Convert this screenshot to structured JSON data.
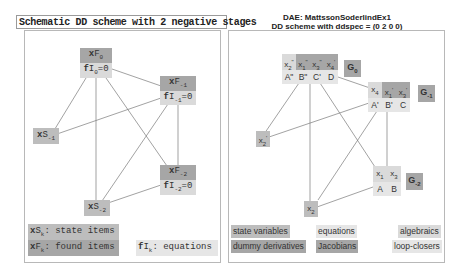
{
  "left_panel": {
    "title": "Schematic DD scheme with 2 negative stages",
    "nodes": {
      "xF0": {
        "var": "x",
        "name": "F",
        "sub": "0"
      },
      "fI0": {
        "var": "f",
        "name": "I",
        "sub": "0",
        "suffix": "=0"
      },
      "xF_1": {
        "var": "x",
        "name": "F",
        "sub": "-1"
      },
      "fI_1": {
        "var": "f",
        "name": "I",
        "sub": "-1",
        "suffix": "=0"
      },
      "xS_1": {
        "var": "x",
        "name": "S",
        "sub": "-1"
      },
      "xF_2": {
        "var": "x",
        "name": "F",
        "sub": "-2"
      },
      "fI_2": {
        "var": "f",
        "name": "I",
        "sub": "-2",
        "suffix": "=0"
      },
      "xS_2": {
        "var": "x",
        "name": "S",
        "sub": "-2"
      }
    },
    "legend": {
      "state": {
        "var": "x",
        "name": "S",
        "sub": "k",
        "text": ": state items"
      },
      "found": {
        "var": "x",
        "name": "F",
        "sub": "k",
        "text": ": found items"
      },
      "equations": {
        "var": "f",
        "name": "I",
        "sub": "k",
        "text": ": equations"
      }
    }
  },
  "right_panel": {
    "title_line1": "DAE: MattssonSoderlindEx1",
    "title_line2": "DD scheme with ddspec = (0  2  0  0)",
    "stage0": {
      "vars": [
        {
          "v": "x",
          "sub": "2",
          "sup": "\"",
          "kind": "state"
        },
        {
          "v": "x",
          "sub": "1",
          "sup": "\"",
          "kind": "dummy"
        },
        {
          "v": "x",
          "sub": "3",
          "sup": "\"",
          "kind": "dummy"
        },
        {
          "v": "x",
          "sub": "4",
          "sup": "'",
          "kind": "dummy"
        }
      ],
      "eqs": [
        "A\"",
        "B\"",
        "C'",
        "D"
      ],
      "group": {
        "label": "G",
        "sub": "0"
      }
    },
    "stage1": {
      "vars": [
        {
          "v": "x",
          "sub": "4",
          "sup": "",
          "kind": "algebraic"
        },
        {
          "v": "x",
          "sub": "1",
          "sup": "'",
          "kind": "dummy"
        },
        {
          "v": "x",
          "sub": "3",
          "sup": "'",
          "kind": "dummy"
        }
      ],
      "eqs": [
        "A'",
        "B'",
        "C"
      ],
      "group": {
        "label": "G",
        "sub": "-1"
      }
    },
    "x2prime": {
      "v": "x",
      "sub": "2",
      "sup": "'"
    },
    "stage2": {
      "vars": [
        {
          "v": "x",
          "sub": "1",
          "sup": ""
        },
        {
          "v": "x",
          "sub": "3",
          "sup": ""
        }
      ],
      "eqs": [
        "A",
        "B"
      ],
      "group": {
        "label": "G",
        "sub": "-2"
      }
    },
    "x2": {
      "v": "x",
      "sub": "2",
      "sup": ""
    },
    "legend": {
      "state_variables": "state variables",
      "dummy_derivatives": "dummy derivatives",
      "equations": "equations",
      "jacobians": "Jacobians",
      "algebraics": "algebraics",
      "loop_closers": "loop-closers"
    }
  },
  "colors": {
    "dark": "#a6a6a6",
    "mid": "#bdbdbd",
    "light": "#dadada",
    "lighter": "#e6e6e6",
    "edge": "#777777",
    "border": "#b8b8b8"
  }
}
